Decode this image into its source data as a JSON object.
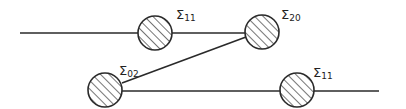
{
  "diagram": {
    "type": "feynman-like self-energy diagram",
    "colors": {
      "stroke": "#2a2a2a",
      "background": "#ffffff"
    },
    "nodes": [
      {
        "id": "n1",
        "symbol": "Σ",
        "subscript": "11",
        "cx": 155,
        "cy": 33,
        "r": 17,
        "label_x": 176,
        "label_y": 8
      },
      {
        "id": "n2",
        "symbol": "Σ",
        "subscript": "20",
        "cx": 262,
        "cy": 32,
        "r": 17,
        "label_x": 281,
        "label_y": 8
      },
      {
        "id": "n3",
        "symbol": "Σ",
        "subscript": "02",
        "cx": 105,
        "cy": 90,
        "r": 17,
        "label_x": 119,
        "label_y": 64
      },
      {
        "id": "n4",
        "symbol": "Σ",
        "subscript": "11",
        "cx": 297,
        "cy": 90,
        "r": 17,
        "label_x": 313,
        "label_y": 66
      }
    ],
    "edges": [
      {
        "id": "top-line-left",
        "x1": 20,
        "y1": 33,
        "x2": 138,
        "y2": 33
      },
      {
        "id": "top-line-mid",
        "x1": 172,
        "y1": 33,
        "x2": 245,
        "y2": 33
      },
      {
        "id": "diagonal",
        "x1": 122,
        "y1": 83,
        "x2": 246,
        "y2": 37
      },
      {
        "id": "bottom-line-mid",
        "x1": 122,
        "y1": 91,
        "x2": 280,
        "y2": 91
      },
      {
        "id": "bottom-line-right",
        "x1": 314,
        "y1": 91,
        "x2": 379,
        "y2": 91
      }
    ]
  },
  "labels": {
    "n1": {
      "symbol": "Σ",
      "sub": "11"
    },
    "n2": {
      "symbol": "Σ",
      "sub": "20"
    },
    "n3": {
      "symbol": "Σ",
      "sub": "02"
    },
    "n4": {
      "symbol": "Σ",
      "sub": "11"
    }
  }
}
